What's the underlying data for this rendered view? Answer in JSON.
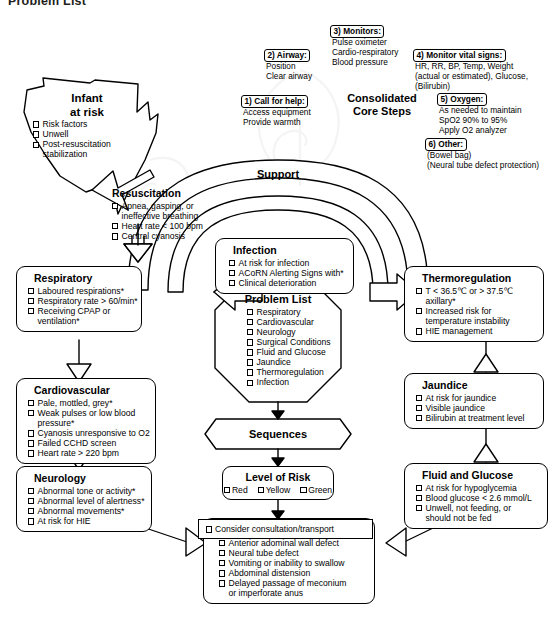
{
  "page_title": "Problem List",
  "core_steps": {
    "title_line1": "Consolidated",
    "title_line2": "Core Steps",
    "items": [
      {
        "label": "1) Call for help:",
        "lines": [
          "Access equipment",
          "Provide warmth"
        ]
      },
      {
        "label": "2) Airway:",
        "lines": [
          "Position",
          "Clear airway"
        ]
      },
      {
        "label": "3) Monitors:",
        "lines": [
          "Pulse oximeter",
          "Cardio-respiratory",
          "Blood pressure"
        ]
      },
      {
        "label": "4) Monitor vital signs:",
        "lines": [
          "HR, RR, BP, Temp, Weight",
          "(actual or estimated), Glucose,",
          "(Bilirubin)"
        ]
      },
      {
        "label": "5) Oxygen:",
        "lines": [
          "As needed to maintain",
          "SpO2 90% to 95%",
          "Apply O2 analyzer"
        ]
      },
      {
        "label": "6) Other:",
        "lines": [
          "(Bowel bag)",
          "(Neural tube defect protection)"
        ]
      }
    ]
  },
  "infant_at_risk": {
    "title_line1": "Infant",
    "title_line2": "at risk",
    "items": [
      "Risk factors",
      "Unwell",
      "Post-resuscitation"
    ],
    "items_cont": [
      "stabilization"
    ]
  },
  "resuscitation": {
    "title": "Resuscitation",
    "items": [
      "Apnea, gasping, or",
      "Heart rate < 100 bpm",
      "Central cyanosis"
    ],
    "cont_after_first": "ineffective breathing"
  },
  "support_label": "Support",
  "infection": {
    "title": "Infection",
    "items": [
      "At risk for infection",
      "ACoRN Alerting Signs with*",
      "Clinical deterioration"
    ]
  },
  "respiratory": {
    "title": "Respiratory",
    "items": [
      "Laboured respirations*",
      "Respiratory rate > 60/min*",
      "Receiving CPAP or"
    ],
    "cont": [
      "ventilation*"
    ]
  },
  "cardiovascular": {
    "title": "Cardiovascular",
    "items": [
      "Pale, mottled, grey*",
      "Weak pulses or low blood",
      "Cyanosis unresponsive to O2",
      "Failed CCHD screen",
      "Heart rate > 220 bpm"
    ],
    "cont_after_second": "pressure*"
  },
  "neurology": {
    "title": "Neurology",
    "items": [
      "Abnormal tone or activity*",
      "Abnormal level of alertness*",
      "Abnormal movements*",
      "At risk for HIE"
    ]
  },
  "thermoregulation": {
    "title": "Thermoregulation",
    "items": [
      "T < 36.5℃ or > 37.5℃",
      "Increased risk for",
      "HIE management"
    ],
    "cont_after_first": "axillary*",
    "cont_after_second": "temperature instability"
  },
  "jaundice": {
    "title": "Jaundice",
    "items": [
      "At risk for jaundice",
      "Visible jaundice",
      "Bilirubin at treatment level"
    ]
  },
  "fluid_glucose": {
    "title": "Fluid and Glucose",
    "items": [
      "At risk for hypoglycemia",
      "Blood glucose < 2.6 mmol/L",
      "Unwell, not feeding, or"
    ],
    "cont": [
      "should not be fed"
    ]
  },
  "surgical_conditions": {
    "title": "Surgical Conditions",
    "items": [
      "Anterior adominal wall defect",
      "Neural tube defect",
      "Vomiting or inability to swallow",
      "Abdominal distension",
      "Delayed passage of meconium"
    ],
    "cont": [
      "or imperforate anus"
    ]
  },
  "problem_list": {
    "title": "Problem List",
    "items": [
      "Respiratory",
      "Cardiovascular",
      "Neurology",
      "Surgical Conditions",
      "Fluid and Glucose",
      "Jaundice",
      "Thermoregulation",
      "Infection"
    ]
  },
  "sequences_label": "Sequences",
  "level_of_risk": {
    "title": "Level of Risk",
    "options": [
      "Red",
      "Yellow",
      "Green"
    ]
  },
  "consultation": "Consider consultation/transport",
  "colors": {
    "stroke": "#000000",
    "fill": "#ffffff",
    "title": "#231f20"
  }
}
